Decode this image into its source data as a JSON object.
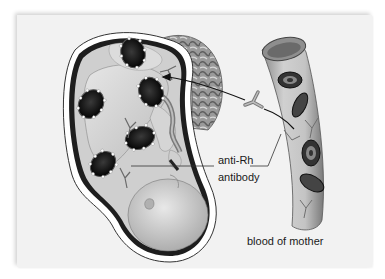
{
  "figure": {
    "colors": {
      "panel_background": "#f2f2f2",
      "outline": "#1a1a1a",
      "tissue_light": "#d9d9d9",
      "tissue_mid": "#a8a8a8",
      "cell_dark": "#151515",
      "label_text": "#1a1a1a"
    }
  },
  "labels": {
    "antibody_line1": "anti-Rh",
    "antibody_line2": "antibody",
    "vessel": "blood of mother"
  },
  "elements": {
    "uterus": "fetus in uterus",
    "placenta": "placenta",
    "fetal_cells": [
      {
        "id": 1,
        "cx": 133,
        "cy": 53
      },
      {
        "id": 2,
        "cx": 151,
        "cy": 92
      },
      {
        "id": 3,
        "cx": 91,
        "cy": 104
      },
      {
        "id": 4,
        "cx": 140,
        "cy": 138
      },
      {
        "id": 5,
        "cx": 103,
        "cy": 164
      }
    ],
    "maternal_rbcs": 4,
    "free_antibody": "Y-shaped antibody between vessel and placenta"
  }
}
